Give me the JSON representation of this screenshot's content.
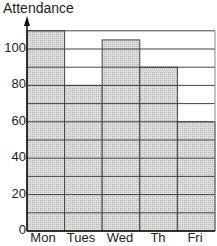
{
  "chart_data": {
    "type": "bar",
    "title": "",
    "xlabel": "",
    "ylabel": "Attendance",
    "categories": [
      "Mon",
      "Tues",
      "Wed",
      "Th",
      "Fri"
    ],
    "values": [
      110,
      80,
      105,
      90,
      60
    ],
    "ylim": [
      0,
      110
    ],
    "yticks": [
      0,
      20,
      40,
      60,
      80,
      100
    ],
    "gridlines_every": 10,
    "grid": true,
    "legend": null,
    "bar_color": "#d9d9d9",
    "grid_color": "#444444"
  }
}
